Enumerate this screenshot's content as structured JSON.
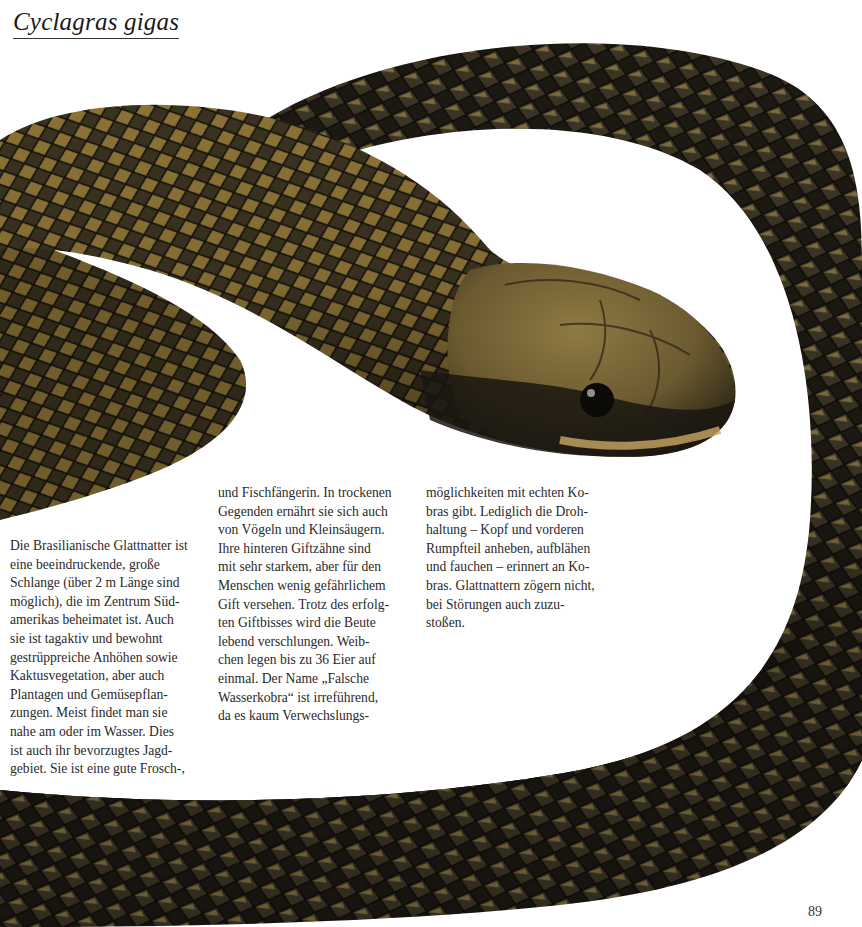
{
  "page": {
    "title": "Cyclagras gigas",
    "page_number": "89",
    "image": {
      "icon": "snake-photo",
      "description": "Brasilianische Glattnatter (Cyclagras gigas), coiled body with olive-yellow and black banded scales, head facing right",
      "colors": {
        "scale_light": "#a8893a",
        "scale_dark": "#1e1a12",
        "highlight": "#d8c07a",
        "background": "#ffffff"
      }
    },
    "columns": [
      {
        "lines": [
          "Die Brasilianische Glattnatter ist",
          "eine beeindruckende, große",
          "Schlange (über 2 m Länge sind",
          "möglich), die im Zentrum Süd-",
          "amerikas beheimatet ist. Auch",
          "sie ist tagaktiv und bewohnt",
          "gestrüppreiche Anhöhen sowie",
          "Kaktusvegetation, aber auch",
          "Plantagen und Gemüsepflan-",
          "zungen. Meist findet man sie",
          "nahe am oder im Wasser. Dies",
          "ist auch ihr bevorzugtes Jagd-",
          "gebiet. Sie ist eine gute Frosch-,"
        ]
      },
      {
        "lines": [
          "und Fischfängerin. In trockenen",
          "Gegenden ernährt sie sich auch",
          "von Vögeln und Kleinsäugern.",
          "Ihre hinteren Giftzähne sind",
          "mit sehr starkem, aber für den",
          "Menschen wenig gefährlichem",
          "Gift versehen. Trotz des erfolg-",
          "ten Giftbisses wird die Beute",
          "lebend verschlungen. Weib-",
          "chen legen bis zu 36 Eier auf",
          "einmal. Der Name „Falsche",
          "Wasserkobra“ ist irreführend,",
          "da es kaum Verwechslungs-"
        ]
      },
      {
        "lines": [
          "möglichkeiten mit echten Ko-",
          "bras gibt. Lediglich die Droh-",
          "haltung – Kopf und vorderen",
          "Rumpfteil anheben, aufblähen",
          "und fauchen – erinnert an Ko-",
          "bras. Glattnattern zögern nicht,",
          "bei Störungen auch zuzu-",
          "stoßen."
        ]
      }
    ]
  }
}
